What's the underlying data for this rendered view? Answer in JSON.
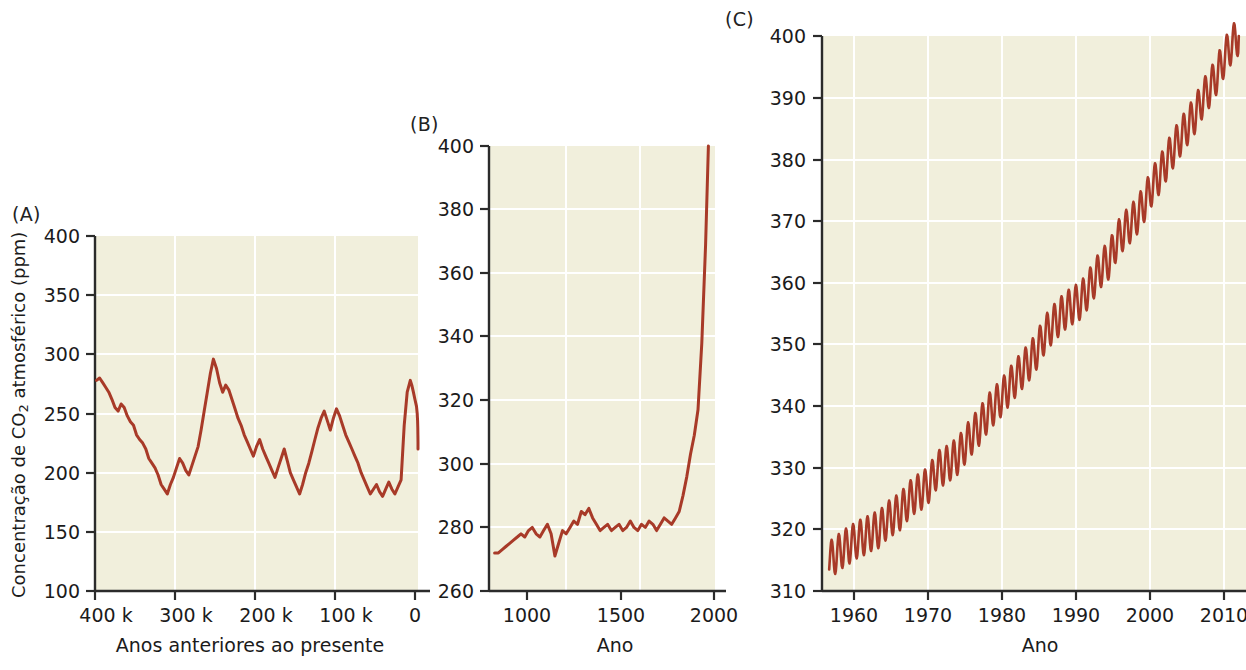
{
  "figure": {
    "y_axis_label_main": "Concentração de CO",
    "y_axis_label_sub": "2",
    "y_axis_label_tail": " atmosférico (ppm)"
  },
  "panels": [
    {
      "label": "(A)",
      "xlabel": "Anos anteriores ao presente",
      "yticks": [
        "100",
        "150",
        "200",
        "250",
        "300",
        "350",
        "400"
      ],
      "xticks": [
        "400 k",
        "300 k",
        "200 k",
        "100 k",
        "0"
      ]
    },
    {
      "label": "(B)",
      "xlabel": "Ano",
      "yticks": [
        "260",
        "280",
        "300",
        "320",
        "340",
        "360",
        "380",
        "400"
      ],
      "xticks": [
        "1000",
        "1500",
        "2000"
      ]
    },
    {
      "label": "(C)",
      "xlabel": "Ano",
      "yticks": [
        "310",
        "320",
        "330",
        "340",
        "350",
        "360",
        "370",
        "380",
        "390",
        "400"
      ],
      "xticks": [
        "1960",
        "1970",
        "1980",
        "1990",
        "2000",
        "2010"
      ]
    }
  ],
  "colors": {
    "line": "#a83a28",
    "plot_background": "#f1efdc",
    "gridline": "#ffffff",
    "axis": "#2b2b2b",
    "text": "#1b1b1b"
  },
  "chart_data": [
    {
      "type": "line",
      "panel": "A",
      "title": "(A)",
      "xlabel": "Anos anteriores ao presente",
      "ylabel": "Concentração de CO2 atmosférico (ppm)",
      "xlim": [
        420000,
        0
      ],
      "ylim": [
        100,
        400
      ],
      "x_reversed": true,
      "ytick_values": [
        100,
        150,
        200,
        250,
        300,
        350,
        400
      ],
      "xtick_values": [
        400000,
        300000,
        200000,
        100000,
        0
      ],
      "xtick_labels": [
        "400 k",
        "300 k",
        "200 k",
        "100 k",
        "0"
      ],
      "grid": true,
      "legend": "none",
      "x": [
        418000,
        414000,
        410000,
        406000,
        402000,
        398000,
        394000,
        390000,
        386000,
        382000,
        378000,
        374000,
        370000,
        366000,
        362000,
        358000,
        354000,
        350000,
        346000,
        342000,
        338000,
        334000,
        330000,
        326000,
        322000,
        318000,
        314000,
        310000,
        306000,
        302000,
        298000,
        294000,
        290000,
        286000,
        282000,
        278000,
        274000,
        270000,
        266000,
        262000,
        258000,
        254000,
        250000,
        246000,
        242000,
        238000,
        234000,
        230000,
        226000,
        222000,
        218000,
        214000,
        210000,
        206000,
        202000,
        198000,
        194000,
        190000,
        186000,
        182000,
        178000,
        174000,
        170000,
        166000,
        162000,
        158000,
        154000,
        150000,
        146000,
        142000,
        138000,
        134000,
        130000,
        126000,
        122000,
        118000,
        114000,
        110000,
        106000,
        102000,
        98000,
        94000,
        90000,
        86000,
        82000,
        78000,
        74000,
        70000,
        66000,
        62000,
        58000,
        54000,
        50000,
        46000,
        42000,
        38000,
        34000,
        30000,
        26000,
        22000,
        18000,
        14000,
        10000,
        8000,
        6000,
        4000,
        2000,
        1000,
        500,
        200,
        100,
        50,
        0
      ],
      "y": [
        278,
        280,
        276,
        272,
        268,
        262,
        255,
        252,
        258,
        255,
        248,
        243,
        240,
        232,
        228,
        225,
        220,
        212,
        208,
        204,
        198,
        190,
        186,
        182,
        190,
        196,
        204,
        212,
        208,
        202,
        198,
        206,
        214,
        222,
        236,
        252,
        268,
        284,
        296,
        288,
        276,
        268,
        274,
        270,
        262,
        254,
        246,
        240,
        232,
        226,
        220,
        214,
        222,
        228,
        220,
        214,
        208,
        202,
        196,
        204,
        212,
        220,
        210,
        200,
        194,
        188,
        182,
        190,
        200,
        208,
        218,
        228,
        238,
        246,
        252,
        244,
        236,
        246,
        254,
        248,
        240,
        232,
        226,
        220,
        214,
        208,
        200,
        194,
        188,
        182,
        186,
        190,
        184,
        180,
        186,
        192,
        186,
        182,
        188,
        194,
        240,
        268,
        278,
        274,
        268,
        262,
        256,
        250,
        244,
        238,
        232,
        226,
        220,
        214,
        208,
        214,
        220,
        214,
        206,
        200,
        194,
        188,
        194,
        200,
        206,
        212,
        206,
        198,
        192,
        186,
        180,
        176,
        182,
        188,
        194,
        200,
        206,
        212,
        206,
        200,
        194,
        188,
        184,
        180,
        186,
        192,
        186,
        180,
        176,
        182,
        188,
        194,
        200,
        206,
        212,
        218,
        224,
        230,
        240,
        252,
        264,
        272,
        278,
        284,
        290,
        300,
        320,
        350,
        380,
        400
      ],
      "notes": "Ice-core record (Vostok/EPICA style): glacial-interglacial cycles oscillating between ~180 ppm (glacial minima) and ~280-300 ppm (interglacial maxima), ending in a near-vertical modern spike to 400 ppm at year 0."
    },
    {
      "type": "line",
      "panel": "B",
      "title": "(B)",
      "xlabel": "Ano",
      "ylabel": "Concentração de CO2 atmosférico (ppm)",
      "xlim": [
        850,
        2050
      ],
      "ylim": [
        260,
        400
      ],
      "ytick_values": [
        260,
        280,
        300,
        320,
        340,
        360,
        380,
        400
      ],
      "xtick_values": [
        1000,
        1500,
        2000
      ],
      "grid": true,
      "legend": "none",
      "x": [
        880,
        900,
        920,
        940,
        960,
        980,
        1000,
        1020,
        1040,
        1060,
        1080,
        1100,
        1120,
        1140,
        1160,
        1180,
        1200,
        1220,
        1240,
        1260,
        1280,
        1300,
        1320,
        1340,
        1360,
        1380,
        1400,
        1420,
        1440,
        1460,
        1480,
        1500,
        1520,
        1540,
        1560,
        1580,
        1600,
        1620,
        1640,
        1660,
        1680,
        1700,
        1720,
        1740,
        1760,
        1780,
        1800,
        1820,
        1840,
        1860,
        1880,
        1900,
        1920,
        1940,
        1960,
        1980,
        2000,
        2015
      ],
      "y": [
        272,
        272,
        273,
        274,
        275,
        276,
        277,
        278,
        277,
        279,
        280,
        278,
        277,
        279,
        281,
        278,
        271,
        275,
        279,
        278,
        280,
        282,
        281,
        285,
        284,
        286,
        283,
        281,
        279,
        280,
        281,
        279,
        280,
        281,
        279,
        280,
        282,
        280,
        279,
        281,
        280,
        282,
        281,
        279,
        281,
        283,
        282,
        281,
        283,
        285,
        290,
        296,
        303,
        309,
        317,
        338,
        369,
        400
      ],
      "notes": "Last ~1100 years: roughly flat around 272-285 ppm until ~1800, then sharp industrial-era rise to 400 ppm."
    },
    {
      "type": "line",
      "panel": "C",
      "title": "(C)",
      "xlabel": "Ano",
      "ylabel": "Concentração de CO2 atmosférico (ppm)",
      "xlim": [
        1957,
        2016
      ],
      "ylim": [
        310,
        400
      ],
      "ytick_values": [
        310,
        320,
        330,
        340,
        350,
        360,
        370,
        380,
        390,
        400
      ],
      "xtick_values": [
        1960,
        1970,
        1980,
        1990,
        2000,
        2010
      ],
      "grid": true,
      "legend": "none",
      "series_description": "Keeling curve: monthly mean CO2 with ~6 ppm peak-to-trough annual seasonal cycle superimposed on rising annual trend.",
      "annual_mean_x": [
        1958,
        1959,
        1960,
        1961,
        1962,
        1963,
        1964,
        1965,
        1966,
        1967,
        1968,
        1969,
        1970,
        1971,
        1972,
        1973,
        1974,
        1975,
        1976,
        1977,
        1978,
        1979,
        1980,
        1981,
        1982,
        1983,
        1984,
        1985,
        1986,
        1987,
        1988,
        1989,
        1990,
        1991,
        1992,
        1993,
        1994,
        1995,
        1996,
        1997,
        1998,
        1999,
        2000,
        2001,
        2002,
        2003,
        2004,
        2005,
        2006,
        2007,
        2008,
        2009,
        2010,
        2011,
        2012,
        2013,
        2014,
        2015
      ],
      "annual_mean_y": [
        315.0,
        315.9,
        316.9,
        317.6,
        318.4,
        318.9,
        319.6,
        320.0,
        321.4,
        322.2,
        323.0,
        324.6,
        325.7,
        326.3,
        327.5,
        329.7,
        330.2,
        331.1,
        332.0,
        333.8,
        335.4,
        336.8,
        338.7,
        340.1,
        341.4,
        343.0,
        344.6,
        346.0,
        347.4,
        349.2,
        351.6,
        353.1,
        354.4,
        355.6,
        356.4,
        357.1,
        358.8,
        360.8,
        362.6,
        363.7,
        366.7,
        368.4,
        369.6,
        371.1,
        373.2,
        375.8,
        377.5,
        379.8,
        381.9,
        383.8,
        385.6,
        387.4,
        389.9,
        391.6,
        393.8,
        396.5,
        398.6,
        400.0
      ],
      "seasonal_amplitude_ppm": 3.0,
      "cycles_per_year": 1
    }
  ]
}
